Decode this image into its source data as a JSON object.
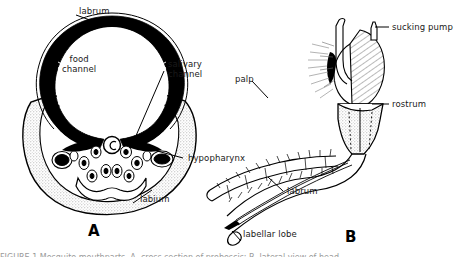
{
  "figure": {
    "background_color": "#ffffff",
    "ink_color": "#000000",
    "stipple_color": "#d8d8d8",
    "panels": [
      {
        "letter": "A",
        "name": "proboscis-cross-section",
        "labels": [
          "labrum",
          "food channel",
          "salivary channel",
          "hypopharynx",
          "labium"
        ]
      },
      {
        "letter": "B",
        "name": "head-lateral-view",
        "labels": [
          "sucking pump",
          "rostrum",
          "palp",
          "labrum",
          "labellar lobe"
        ]
      }
    ]
  },
  "panel_a": {
    "letter": "A",
    "labels": {
      "labrum": "labrum",
      "food_channel_line1": "food",
      "food_channel_line2": "channel",
      "salivary_channel_line1": "salivary",
      "salivary_channel_line2": "channel",
      "hypopharynx": "hypopharynx",
      "labium": "labium"
    }
  },
  "panel_b": {
    "letter": "B",
    "labels": {
      "sucking_pump": "sucking pump",
      "rostrum": "rostrum",
      "palp": "palp",
      "labrum": "labrum",
      "labellar_lobe": "labellar lobe"
    }
  },
  "caption": {
    "cropped_line": "FIGURE 1   Mosquito mouthparts.  A, cross section of proboscis;  B, lateral view of head."
  }
}
